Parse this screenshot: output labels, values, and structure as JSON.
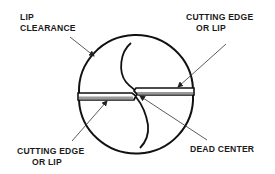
{
  "figure": {
    "colors": {
      "outline": "#111111",
      "lip_fill": "#9a9a9a",
      "leader": "#333333",
      "text": "#1a1a1a",
      "background": "#ffffff"
    }
  },
  "labels": {
    "lip_clearance": {
      "line1": "LIP",
      "line2": "CLEARANCE"
    },
    "cutting_edge_top": {
      "line1": "CUTTING EDGE",
      "line2": "OR LIP"
    },
    "cutting_edge_bottom": {
      "line1": "CUTTING EDGE",
      "line2": "OR LIP"
    },
    "dead_center": {
      "line1": "DEAD CENTER"
    }
  }
}
